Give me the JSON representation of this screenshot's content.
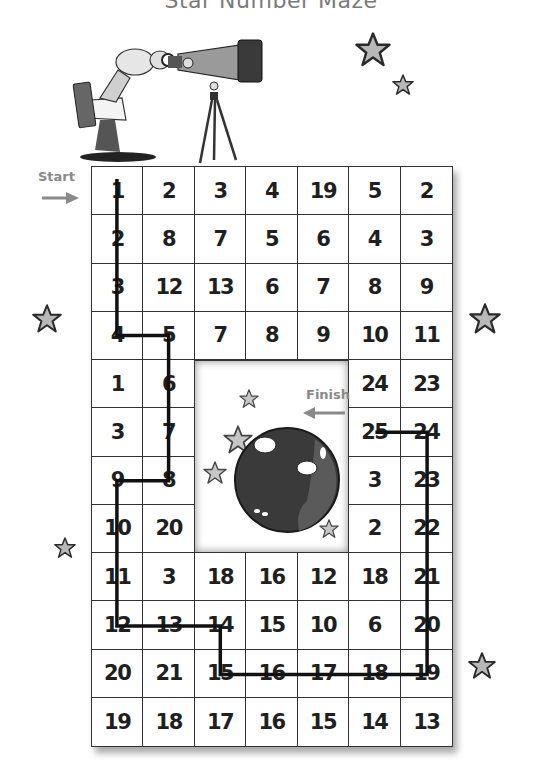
{
  "title": "Star Number Maze",
  "start_label": "Start",
  "finish_label": "Finish",
  "colors": {
    "grid_line": "#333333",
    "number_text": "#1f1f1f",
    "path_line": "#111111",
    "label_gray": "#8a8a8a",
    "star_fill": "#b8b8b8",
    "planet_fill": "#3a3a3a"
  },
  "grid": {
    "columns": 7,
    "rows": 12,
    "hole": {
      "col_start": 2,
      "col_end": 4,
      "row_start": 4,
      "row_end": 7
    },
    "cells": [
      [
        "1",
        "2",
        "3",
        "4",
        "19",
        "5",
        "2"
      ],
      [
        "2",
        "8",
        "7",
        "5",
        "6",
        "4",
        "3"
      ],
      [
        "3",
        "12",
        "13",
        "6",
        "7",
        "8",
        "9"
      ],
      [
        "4",
        "5",
        "7",
        "8",
        "9",
        "10",
        "11"
      ],
      [
        "1",
        "6",
        "",
        "",
        "",
        "24",
        "23"
      ],
      [
        "3",
        "7",
        "",
        "",
        "",
        "25",
        "24"
      ],
      [
        "9",
        "8",
        "",
        "",
        "",
        "3",
        "23"
      ],
      [
        "10",
        "20",
        "",
        "",
        "",
        "2",
        "22"
      ],
      [
        "11",
        "3",
        "18",
        "16",
        "12",
        "18",
        "21"
      ],
      [
        "12",
        "13",
        "14",
        "15",
        "10",
        "6",
        "20"
      ],
      [
        "20",
        "21",
        "15",
        "16",
        "17",
        "18",
        "19"
      ],
      [
        "19",
        "18",
        "17",
        "16",
        "15",
        "14",
        "13"
      ]
    ]
  },
  "solution_path": {
    "sequence": [
      "1",
      "2",
      "3",
      "4",
      "5",
      "6",
      "7",
      "8",
      "9",
      "10",
      "11",
      "12",
      "13",
      "14",
      "15",
      "16",
      "17",
      "18",
      "19",
      "20",
      "21",
      "22",
      "23",
      "24",
      "25"
    ],
    "cells_row_col": [
      [
        0,
        0
      ],
      [
        1,
        0
      ],
      [
        2,
        0
      ],
      [
        3,
        0
      ],
      [
        3,
        1
      ],
      [
        4,
        1
      ],
      [
        5,
        1
      ],
      [
        6,
        1
      ],
      [
        6,
        0
      ],
      [
        7,
        0
      ],
      [
        8,
        0
      ],
      [
        9,
        0
      ],
      [
        9,
        1
      ],
      [
        9,
        2
      ],
      [
        10,
        2
      ],
      [
        10,
        3
      ],
      [
        10,
        4
      ],
      [
        10,
        5
      ],
      [
        10,
        6
      ],
      [
        9,
        6
      ],
      [
        8,
        6
      ],
      [
        7,
        6
      ],
      [
        6,
        6
      ],
      [
        5,
        6
      ],
      [
        5,
        5
      ]
    ]
  },
  "illustration": {
    "scientist": "scientist-with-clipboard-icon",
    "telescope": "telescope-on-tripod-icon",
    "planet": "cratered-planet-icon",
    "stars": "star-icon"
  }
}
